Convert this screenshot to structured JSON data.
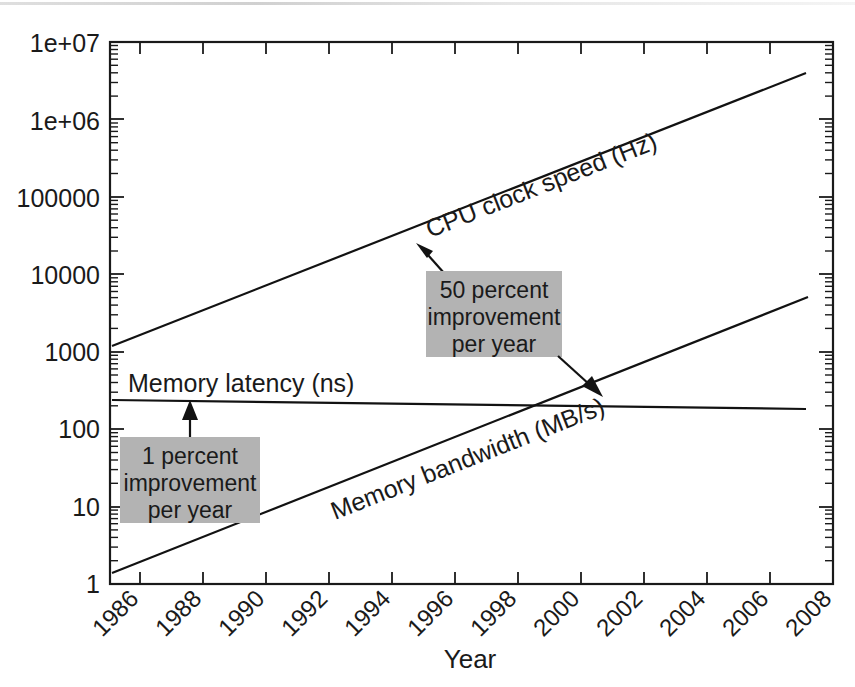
{
  "chart_data": {
    "type": "line",
    "title": "",
    "xlabel": "Year",
    "ylabel": "",
    "xlim": [
      1985,
      2009
    ],
    "ylim": [
      1,
      10000000
    ],
    "yscale": "log",
    "grid": false,
    "legend_position": "inline-labels",
    "xticks": [
      "1986",
      "1988",
      "1990",
      "1992",
      "1994",
      "1996",
      "1998",
      "2000",
      "2002",
      "2004",
      "2006",
      "2008"
    ],
    "ytick_labels": [
      "1e+07",
      "1e+06",
      "100000",
      "10000",
      "1000",
      "100",
      "10",
      "1"
    ],
    "ytick_values": [
      10000000,
      1000000,
      100000,
      10000,
      1000,
      100,
      10,
      1
    ],
    "series": [
      {
        "name": "CPU clock speed (Hz)",
        "label": "CPU clock speed (Hz)",
        "unit": "Hz",
        "growth_per_year_percent": 50,
        "x": [
          1985,
          2007
        ],
        "values": [
          1200,
          4300000
        ]
      },
      {
        "name": "Memory bandwidth (MB/s)",
        "label": "Memory bandwidth (MB/s)",
        "unit": "MB/s",
        "x": [
          1985,
          2007
        ],
        "values": [
          1.35,
          5000
        ]
      },
      {
        "name": "Memory latency (ns)",
        "label": "Memory latency (ns)",
        "unit": "ns",
        "growth_per_year_percent": 1,
        "x": [
          1985,
          2007
        ],
        "values": [
          245,
          180
        ]
      }
    ],
    "annotations": [
      {
        "id": "fifty-percent",
        "text_lines": [
          "50 percent",
          "improvement",
          "per year"
        ],
        "target_series": "CPU clock speed (Hz)",
        "box_color": "#b3b3b3"
      },
      {
        "id": "one-percent",
        "text_lines": [
          "1 percent",
          "improvement",
          "per year"
        ],
        "target_series": "Memory latency (ns)",
        "box_color": "#b3b3b3"
      }
    ]
  },
  "axes": {
    "x_title": "Year",
    "y_title": ""
  },
  "colors": {
    "line": "#121212",
    "annotation_box": "#b3b3b3",
    "background": "#ffffff",
    "text": "#1a1a1a"
  }
}
